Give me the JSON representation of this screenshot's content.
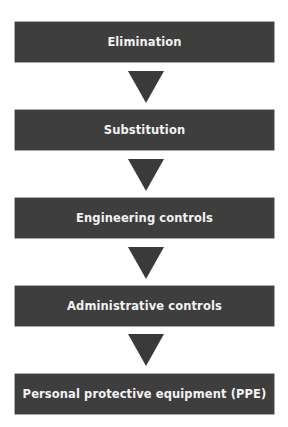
{
  "diagram": {
    "type": "hierarchy-of-controls",
    "colors": {
      "box_fill": "#3e3e3e",
      "box_text": "#f2f2f2",
      "arrow_fill": "#3a3a3a",
      "background": "#ffffff"
    },
    "steps": [
      {
        "label": "Elimination"
      },
      {
        "label": "Substitution"
      },
      {
        "label": "Engineering controls"
      },
      {
        "label": "Administrative controls"
      },
      {
        "label": "Personal protective equipment (PPE)"
      }
    ],
    "arrows": [
      {
        "from": "Elimination",
        "to": "Substitution",
        "icon": "down-triangle-arrow"
      },
      {
        "from": "Substitution",
        "to": "Engineering controls",
        "icon": "down-triangle-arrow"
      },
      {
        "from": "Engineering controls",
        "to": "Administrative controls",
        "icon": "down-triangle-arrow"
      },
      {
        "from": "Administrative controls",
        "to": "Personal protective equipment (PPE)",
        "icon": "down-triangle-arrow"
      }
    ]
  }
}
